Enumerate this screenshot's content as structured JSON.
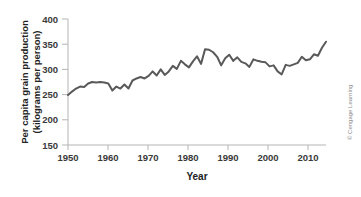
{
  "figure": {
    "credit": "© Cengage Learning"
  },
  "chart_data": {
    "type": "line",
    "title": "",
    "xlabel": "Year",
    "ylabel": "Per capita grain production (kilograms per person)",
    "ylabel_line1": "Per capita grain production",
    "ylabel_line2": "(kilograms per person)",
    "xlim": [
      1950,
      2014
    ],
    "ylim": [
      150,
      400
    ],
    "xticks": [
      1950,
      1960,
      1970,
      1980,
      1990,
      2000,
      2010
    ],
    "xtick_labels": [
      "1950",
      "1960",
      "1970",
      "1980",
      "1990",
      "2000",
      "2010"
    ],
    "yticks": [
      150,
      200,
      250,
      300,
      350,
      400
    ],
    "ytick_labels": [
      "150",
      "200",
      "250",
      "300",
      "350",
      "400"
    ],
    "grid": false,
    "legend": false,
    "line_color": "#595959",
    "axis_color": "#b5b5b5",
    "series": [
      {
        "name": "Per capita grain production",
        "x": [
          1950,
          1951,
          1952,
          1953,
          1954,
          1955,
          1956,
          1957,
          1958,
          1959,
          1960,
          1961,
          1962,
          1963,
          1964,
          1965,
          1966,
          1967,
          1968,
          1969,
          1970,
          1971,
          1972,
          1973,
          1974,
          1975,
          1976,
          1977,
          1978,
          1979,
          1980,
          1981,
          1982,
          1983,
          1984,
          1985,
          1986,
          1987,
          1988,
          1989,
          1990,
          1991,
          1992,
          1993,
          1994,
          1995,
          1996,
          1997,
          1998,
          1999,
          2000,
          2001,
          2002,
          2003,
          2004,
          2005,
          2006,
          2007,
          2008,
          2009,
          2010,
          2011,
          2012,
          2013,
          2014
        ],
        "values": [
          249,
          256,
          262,
          266,
          265,
          272,
          275,
          274,
          275,
          274,
          272,
          258,
          266,
          262,
          270,
          262,
          278,
          282,
          285,
          282,
          287,
          296,
          288,
          300,
          289,
          296,
          307,
          301,
          317,
          310,
          304,
          316,
          326,
          311,
          340,
          339,
          334,
          325,
          308,
          322,
          329,
          317,
          324,
          315,
          312,
          305,
          320,
          317,
          315,
          314,
          306,
          308,
          296,
          290,
          309,
          307,
          310,
          313,
          325,
          318,
          320,
          330,
          327,
          343,
          355
        ]
      }
    ]
  }
}
